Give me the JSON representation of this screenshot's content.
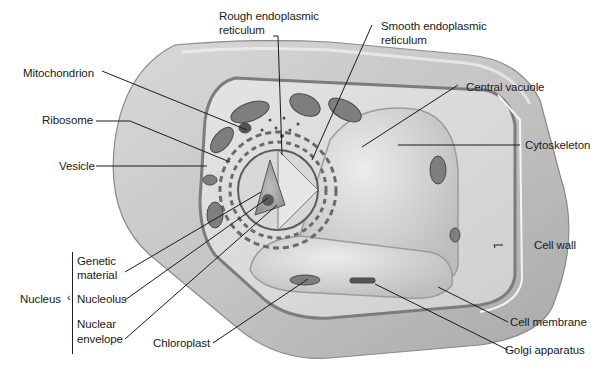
{
  "diagram": {
    "colors": {
      "background": "#ffffff",
      "cell_wall_outer": "#c8c8c8",
      "cell_wall_dark": "#9a9a9a",
      "cytoplasm": "#dcdcdc",
      "vacuole": "#d2d2d2",
      "organelle_dark": "#555555",
      "leader_line": "#1a1a1a",
      "label_text": "#1a1a1a"
    },
    "labels": {
      "rough_er_1": "Rough endoplasmic",
      "rough_er_2": "reticulum",
      "smooth_er_1": "Smooth endoplasmic",
      "smooth_er_2": "reticulum",
      "mitochondrion": "Mitochondrion",
      "ribosome": "Ribosome",
      "vesicle": "Vesicle",
      "central_vacuole": "Central vacuole",
      "cytoskeleton": "Cytoskeleton",
      "cell_wall": "Cell wall",
      "nucleus": "Nucleus",
      "genetic_material_1": "Genetic",
      "genetic_material_2": "material",
      "nucleolus": "Nucleolus",
      "nuclear_envelope_1": "Nuclear",
      "nuclear_envelope_2": "envelope",
      "chloroplast": "Chloroplast",
      "cell_membrane": "Cell membrane",
      "golgi_apparatus": "Golgi apparatus"
    }
  }
}
